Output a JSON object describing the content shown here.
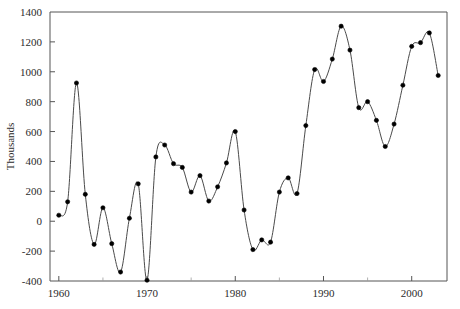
{
  "chart_data": {
    "type": "line",
    "title": "",
    "subtitle": "",
    "xlabel": "",
    "ylabel": "Thousands",
    "xlim": [
      1959,
      2004
    ],
    "ylim": [
      -400,
      1400
    ],
    "grid": false,
    "legend": null,
    "markers": true,
    "interpolation": "spline",
    "xticks": [
      1960,
      1970,
      1980,
      1990,
      2000
    ],
    "xticklabels": [
      "1960",
      "1970",
      "1980",
      "1990",
      "2000"
    ],
    "xminorticks": [
      1965,
      1975,
      1985,
      1995
    ],
    "yticks": [
      -400,
      -200,
      0,
      200,
      400,
      600,
      800,
      1000,
      1200,
      1400
    ],
    "yticklabels": [
      "-400",
      "-200",
      "0",
      "200",
      "400",
      "600",
      "800",
      "1000",
      "1200",
      "1400"
    ],
    "series": [
      {
        "name": "value",
        "x": [
          1960,
          1961,
          1962,
          1963,
          1964,
          1965,
          1966,
          1967,
          1968,
          1969,
          1970,
          1971,
          1972,
          1973,
          1974,
          1975,
          1976,
          1977,
          1978,
          1979,
          1980,
          1981,
          1982,
          1983,
          1984,
          1985,
          1986,
          1987,
          1988,
          1989,
          1990,
          1991,
          1992,
          1993,
          1994,
          1995,
          1996,
          1997,
          1998,
          1999,
          2000,
          2001,
          2002,
          2003
        ],
        "y": [
          40,
          130,
          925,
          180,
          -155,
          90,
          -150,
          -340,
          20,
          250,
          -395,
          430,
          510,
          385,
          360,
          195,
          305,
          135,
          230,
          390,
          600,
          75,
          -190,
          -125,
          -140,
          195,
          290,
          185,
          640,
          1015,
          935,
          1085,
          1305,
          1145,
          760,
          800,
          675,
          500,
          650,
          910,
          1170,
          1195,
          1260,
          975
        ]
      }
    ],
    "colors": {
      "line": "#4a4a4a",
      "marker": "#000000",
      "axis": "#555555",
      "text": "#2b2b2b",
      "background": "#ffffff"
    }
  },
  "layout": {
    "plot_left": 50,
    "plot_right": 447,
    "plot_top": 12,
    "plot_bottom": 281
  }
}
